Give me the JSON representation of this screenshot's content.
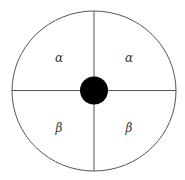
{
  "diagram": {
    "shape": "circle divided into four quadrants with a filled center dot",
    "colors": {
      "stroke": "#555555",
      "dot": "#000000",
      "background": "#ffffff",
      "label": "#333333"
    },
    "quadrants": [
      {
        "position": "top-left",
        "label": "α"
      },
      {
        "position": "top-right",
        "label": "α"
      },
      {
        "position": "bottom-left",
        "label": "β"
      },
      {
        "position": "bottom-right",
        "label": "β"
      }
    ]
  }
}
